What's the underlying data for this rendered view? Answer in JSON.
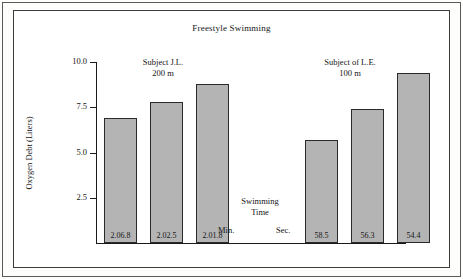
{
  "figure": {
    "title": "Freestyle Swimming"
  },
  "chart_data": {
    "type": "bar",
    "title": "Freestyle Swimming",
    "xlabel": "Swimming Time",
    "ylabel": "Oxygen Debt (Liters)",
    "ylim": [
      0,
      10.0
    ],
    "ytick_labels": [
      "10.0",
      "7.5",
      "5.0",
      "2.5"
    ],
    "yticks": [
      10.0,
      7.5,
      5.0,
      2.5
    ],
    "grid": false,
    "legend": "none",
    "groups": [
      {
        "name": "Subject J.L.",
        "distance": "200 m",
        "time_unit": "Min.",
        "categories": [
          "2.06.8",
          "2.02.5",
          "2.01.8"
        ],
        "values": [
          6.9,
          7.8,
          8.8
        ]
      },
      {
        "name": "Subject of L.E.",
        "distance": "100 m",
        "time_unit": "Sec.",
        "categories": [
          "58.5",
          "56.3",
          "54.4"
        ],
        "values": [
          5.7,
          7.4,
          9.4
        ]
      }
    ],
    "categories": [
      "2.06.8",
      "2.02.5",
      "2.01.8",
      "58.5",
      "56.3",
      "54.4"
    ],
    "values": [
      6.9,
      7.8,
      8.8,
      5.7,
      7.4,
      9.4
    ],
    "bar_color": "#b4b4b4",
    "bar_edge_color": "#2a2a2a",
    "axis_color": "#1a1a1a"
  },
  "axis": {
    "y_label": "Oxygen Debt (Liters)",
    "ticks": [
      {
        "label": "10.0"
      },
      {
        "label": "7.5"
      },
      {
        "label": "5.0"
      },
      {
        "label": "2.5"
      }
    ]
  },
  "groups": {
    "left": {
      "subject": "Subject J.L.",
      "distance": "200 m",
      "unit": "Min."
    },
    "right": {
      "subject": "Subject of L.E.",
      "distance": "100 m",
      "unit": "Sec."
    }
  },
  "center_caption": {
    "line1": "Swimming",
    "line2": "Time"
  },
  "bars": [
    {
      "label": "2.06.8",
      "value": 6.9
    },
    {
      "label": "2.02.5",
      "value": 7.8
    },
    {
      "label": "2.01.8",
      "value": 8.8
    },
    {
      "label": "58.5",
      "value": 5.7
    },
    {
      "label": "56.3",
      "value": 7.4
    },
    {
      "label": "54.4",
      "value": 9.4
    }
  ]
}
